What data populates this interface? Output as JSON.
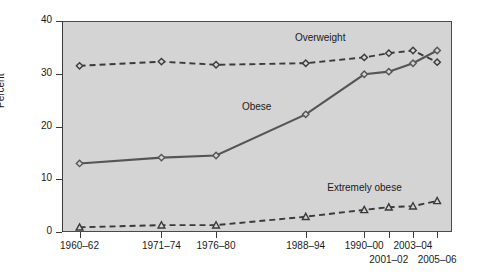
{
  "chart_data": {
    "type": "line",
    "title": "",
    "subtitle": "",
    "xlabel": "",
    "ylabel": "Percent",
    "ylim": [
      0,
      40
    ],
    "yticks": [
      0,
      10,
      20,
      30,
      40
    ],
    "grid": false,
    "legend_position": "inline-annotations",
    "categories": [
      "1960–62",
      "1971–74",
      "1976–80",
      "1988–94",
      "1990–00",
      "2001–02",
      "2003–04",
      "2005–06"
    ],
    "series": [
      {
        "name": "Overweight",
        "values": [
          31.5,
          32.3,
          31.7,
          32.0,
          33.1,
          33.9,
          34.4,
          32.2
        ],
        "style": "dashed",
        "marker": "diamond",
        "color": "#3a3a3a"
      },
      {
        "name": "Obese",
        "values": [
          13.0,
          14.1,
          14.5,
          22.3,
          29.9,
          30.4,
          32.0,
          34.4
        ],
        "style": "solid",
        "marker": "diamond",
        "color": "#555555"
      },
      {
        "name": "Extremely obese",
        "values": [
          0.9,
          1.3,
          1.3,
          2.9,
          4.2,
          4.7,
          4.9,
          5.9
        ],
        "style": "dashed",
        "marker": "triangle",
        "color": "#3a3a3a"
      }
    ],
    "annotations": [
      {
        "text": "Overweight",
        "x": 3.25,
        "y": 36.6
      },
      {
        "text": "Obese",
        "x": 2.45,
        "y": 23.6
      },
      {
        "text": "Extremely obese",
        "x": 4.0,
        "y": 8.1
      }
    ]
  },
  "axes": {
    "y_title": "Percent",
    "y_tick_labels": [
      "0",
      "10",
      "20",
      "30",
      "40"
    ],
    "x_tick_labels": [
      "1960–62",
      "1971–74",
      "1976–80",
      "1988–94",
      "1990–00",
      "2001–02",
      "2003–04",
      "2005–06"
    ]
  },
  "colors": {
    "plot_background": "#d4d4d4",
    "page_background": "#ffffff",
    "axis": "#3a3a3a",
    "overweight": "#3a3a3a",
    "obese": "#555555",
    "extremely_obese": "#3a3a3a"
  }
}
